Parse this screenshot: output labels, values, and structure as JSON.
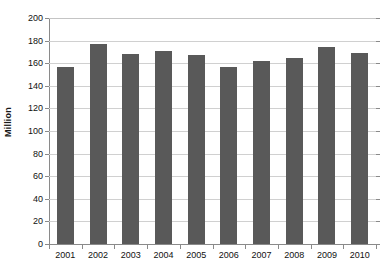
{
  "chart_data": {
    "type": "bar",
    "title": "",
    "subtitle": "",
    "xlabel": "",
    "ylabel": "Million",
    "categories": [
      "2001",
      "2002",
      "2003",
      "2004",
      "2005",
      "2006",
      "2007",
      "2008",
      "2009",
      "2010"
    ],
    "values": [
      157,
      177,
      168,
      171,
      167,
      157,
      162,
      165,
      174,
      169
    ],
    "series": [
      {
        "name": "",
        "values": [
          157,
          177,
          168,
          171,
          167,
          157,
          162,
          165,
          174,
          169
        ]
      }
    ],
    "ylim": [
      0,
      200
    ],
    "yticks": [
      0,
      20,
      40,
      60,
      80,
      100,
      120,
      140,
      160,
      180,
      200
    ],
    "ytick_labels": [
      "0",
      "20",
      "40",
      "60",
      "80",
      "100",
      "120",
      "140",
      "160",
      "180",
      "200"
    ],
    "grid": true,
    "grid_axis": "y",
    "legend": false,
    "legend_position": "none",
    "bar_color": "#595959",
    "gridline_color": "#d0d0d0",
    "axis_color": "#8a8a8a",
    "text_color": "#111111",
    "background_color": "#ffffff"
  }
}
